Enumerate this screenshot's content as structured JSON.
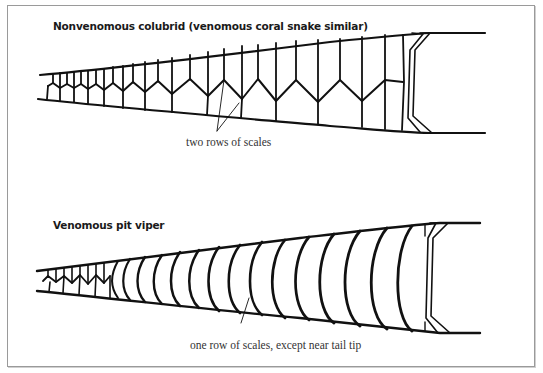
{
  "figure": {
    "panels": [
      {
        "id": "colubrid",
        "title": "Nonvenomous colubrid (venomous coral snake similar)",
        "callout": "two rows of scales",
        "scale_pattern": "two rows (divided subcaudal scales)"
      },
      {
        "id": "pit-viper",
        "title": "Venomous pit viper",
        "callout": "one row of scales, except near tail tip",
        "scale_pattern": "single row (undivided subcaudal scales)"
      }
    ]
  },
  "colors": {
    "ink": "#111111",
    "frame": "#9a9a9a",
    "background": "#ffffff",
    "text": "#333333"
  }
}
